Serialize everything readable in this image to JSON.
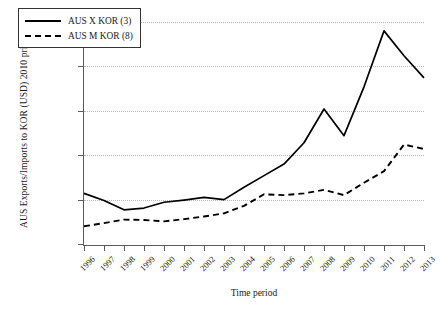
{
  "figure": {
    "ylabel": "AUS Exports/Imports to KOR (USD) 2010 prices",
    "xlabel": "Time period"
  },
  "legend": {
    "items": [
      {
        "label": "AUS X KOR (3)",
        "style": "solid"
      },
      {
        "label": "AUS M KOR (8)",
        "style": "dashed"
      }
    ]
  },
  "axes": {
    "yticks": [
      "0",
      "5 000 m",
      "10 000 m",
      "15 000 m",
      "20 000 m",
      "25 000 m"
    ],
    "yvalues": [
      0,
      5000,
      10000,
      15000,
      20000,
      25000
    ],
    "xticks": [
      "1996",
      "1997",
      "1998",
      "1999",
      "2000",
      "2001",
      "2002",
      "2003",
      "2004",
      "2005",
      "2006",
      "2007",
      "2008",
      "2009",
      "2010",
      "2011",
      "2012",
      "2013"
    ]
  },
  "chart_data": {
    "type": "line",
    "title": "",
    "xlabel": "Time period",
    "ylabel": "AUS Exports/Imports to KOR (USD) 2010 prices",
    "x": [
      1996,
      1997,
      1998,
      1999,
      2000,
      2001,
      2002,
      2003,
      2004,
      2005,
      2006,
      2007,
      2008,
      2009,
      2010,
      2011,
      2012,
      2013
    ],
    "ylim": [
      0,
      25000
    ],
    "xlim": [
      1996,
      2013
    ],
    "grid": true,
    "legend_position": "top-left",
    "series": [
      {
        "name": "AUS X KOR (3)",
        "style": "solid",
        "values": [
          5700,
          4900,
          3850,
          4050,
          4700,
          4950,
          5250,
          5000,
          6400,
          7700,
          9000,
          11400,
          15200,
          12200,
          17700,
          24000,
          21200,
          18700
        ]
      },
      {
        "name": "AUS M KOR (8)",
        "style": "dashed",
        "values": [
          2000,
          2350,
          2750,
          2700,
          2550,
          2800,
          3100,
          3450,
          4300,
          5600,
          5500,
          5700,
          6100,
          5500,
          6900,
          8200,
          11200,
          10700
        ]
      }
    ]
  }
}
